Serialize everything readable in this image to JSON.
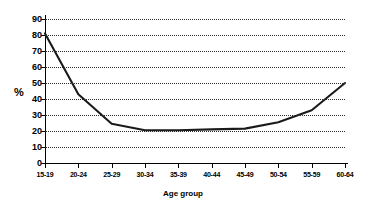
{
  "chart_data": {
    "type": "line",
    "title": "",
    "xlabel": "Age group",
    "ylabel": "%",
    "categories": [
      "15-19",
      "20-24",
      "25-29",
      "30-34",
      "35-39",
      "40-44",
      "45-49",
      "50-54",
      "55-59",
      "60-64"
    ],
    "values": [
      81,
      43,
      24.5,
      20.5,
      20.5,
      21,
      21.5,
      25.5,
      33,
      50
    ],
    "series": [
      {
        "name": "",
        "values": [
          81,
          43,
          24.5,
          20.5,
          20.5,
          21,
          21.5,
          25.5,
          33,
          50
        ]
      }
    ],
    "ylim": [
      0,
      90
    ],
    "ytick_labels": [
      "0",
      "10",
      "20",
      "30",
      "40",
      "50",
      "60",
      "70",
      "80",
      "90"
    ],
    "ytick_values": [
      0,
      10,
      20,
      30,
      40,
      50,
      60,
      70,
      80,
      90
    ],
    "grid": true,
    "grid_style": "dotted-horizontal",
    "legend": "none",
    "line_color": "#1a1a1a",
    "axis_color": "#000000",
    "background_color": "#ffffff"
  }
}
